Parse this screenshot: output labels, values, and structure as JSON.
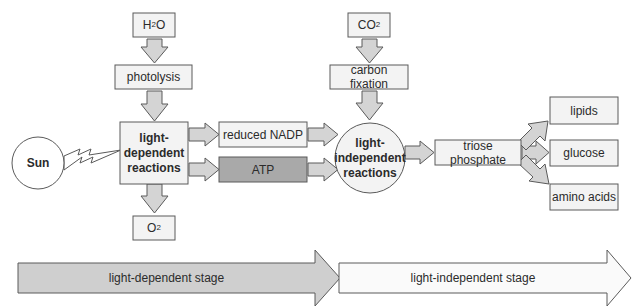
{
  "diagram": {
    "title": "",
    "colors": {
      "box_fill": "#f3f3f3",
      "box_stroke": "#5a5a5a",
      "arrow_fill": "#d4d4d4",
      "atp_fill": "#a9a9a9",
      "dependent_stage_fill": "#cfcfcf",
      "independent_stage_fill": "#fafafa"
    },
    "nodes": {
      "h2o": {
        "main": "H",
        "sub": "2",
        "tail": "O"
      },
      "photolysis": "photolysis",
      "light_dependent": "light-\ndependent\nreactions",
      "sun": "Sun",
      "reduced_nadp": "reduced NADP",
      "atp": "ATP",
      "o2": {
        "main": "O",
        "sub": "2"
      },
      "co2": {
        "main": "CO",
        "sub": "2"
      },
      "carbon_fixation": "carbon fixation",
      "light_independent": "light-\nindependent\nreactions",
      "triose_phosphate": "triose phosphate",
      "lipids": "lipids",
      "glucose": "glucose",
      "amino_acids": "amino acids"
    },
    "stages": {
      "dependent": "light-dependent stage",
      "independent": "light-independent stage"
    },
    "edges": [
      [
        "H2O",
        "photolysis"
      ],
      [
        "photolysis",
        "light-dependent reactions"
      ],
      [
        "Sun",
        "light-dependent reactions"
      ],
      [
        "light-dependent reactions",
        "reduced NADP"
      ],
      [
        "light-dependent reactions",
        "ATP"
      ],
      [
        "light-dependent reactions",
        "O2"
      ],
      [
        "reduced NADP",
        "light-independent reactions"
      ],
      [
        "ATP",
        "light-independent reactions"
      ],
      [
        "CO2",
        "carbon fixation"
      ],
      [
        "carbon fixation",
        "light-independent reactions"
      ],
      [
        "light-independent reactions",
        "triose phosphate"
      ],
      [
        "triose phosphate",
        "lipids"
      ],
      [
        "triose phosphate",
        "glucose"
      ],
      [
        "triose phosphate",
        "amino acids"
      ]
    ]
  }
}
